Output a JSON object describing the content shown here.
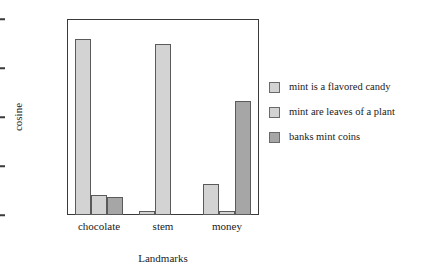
{
  "chart_data": {
    "type": "bar",
    "title": "",
    "xlabel": "Landmarks",
    "ylabel": "cosine",
    "categories": [
      "chocolate",
      "stem",
      "money"
    ],
    "series": [
      {
        "name": "mint is a flavored candy",
        "color": "#d3d3d3",
        "values": [
          0.9,
          0.02,
          0.16
        ]
      },
      {
        "name": "mint are leaves of a plant",
        "color": "#d3d3d3",
        "values": [
          0.1,
          0.875,
          0.02
        ]
      },
      {
        "name": "banks mint coins",
        "color": "#a6a6a6",
        "values": [
          0.09,
          0.0,
          0.58
        ]
      }
    ],
    "ylim": [
      0,
      1
    ],
    "yticks": [
      "0",
      "0.25",
      "0.5",
      "0.75",
      "1"
    ],
    "ytick_values": [
      0,
      0.25,
      0.5,
      0.75,
      1
    ],
    "grid": false,
    "legend_position": "right",
    "bar_edge_color": "#5a5a5a",
    "frame_color": "#3a3a3a"
  }
}
